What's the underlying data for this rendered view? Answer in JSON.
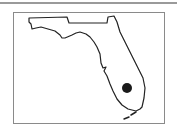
{
  "map": {
    "region": "Florida",
    "marker": {
      "label": "location-marker",
      "cx": 127,
      "cy": 88,
      "r": 5,
      "color": "#1a1a1a"
    },
    "outline_color": "#222222",
    "frame_color": "#8a8a8a"
  }
}
